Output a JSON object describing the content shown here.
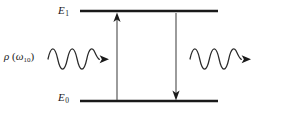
{
  "figure": {
    "type": "energy-level-diagram",
    "background_color": "#ffffff",
    "ink_color": "#1a1a1a",
    "width": 299,
    "height": 119
  },
  "levels": [
    {
      "id": "upper",
      "label_base": "E",
      "label_sub": "1",
      "label_text": "E1",
      "y": 11,
      "x_start": 80,
      "x_end": 218,
      "thickness": 2.6
    },
    {
      "id": "lower",
      "label_base": "E",
      "label_sub": "0",
      "label_text": "E0",
      "y": 101,
      "x_start": 80,
      "x_end": 218,
      "thickness": 2.6
    }
  ],
  "radiation_label": {
    "rho": "ρ",
    "open_paren": "(",
    "omega": "ω",
    "omega_sub": "10",
    "close_paren": ")",
    "full_text": "ρ (ω₁₀)"
  },
  "waves": [
    {
      "id": "incident-wave",
      "name": "incoming-photon-wave",
      "x_start": 48,
      "x_end": 100,
      "center_y": 59,
      "amplitude": 7,
      "cycles": 4.5,
      "arrow_direction": "right",
      "arrow_tip_x": 109
    },
    {
      "id": "emitted-wave",
      "name": "outgoing-photon-wave",
      "x_start": 190,
      "x_end": 242,
      "center_y": 59,
      "amplitude": 7,
      "cycles": 4.5,
      "arrow_direction": "right",
      "arrow_tip_x": 251
    }
  ],
  "transitions": [
    {
      "id": "absorption-arrow",
      "name": "upward-absorption-arrow",
      "x": 117,
      "y_from": 100,
      "y_to": 15,
      "direction": "up"
    },
    {
      "id": "emission-arrow",
      "name": "downward-emission-arrow",
      "x": 176,
      "y_from": 13,
      "y_to": 99,
      "direction": "down"
    }
  ]
}
